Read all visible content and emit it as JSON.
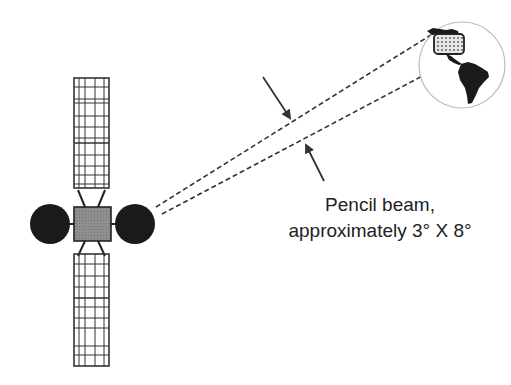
{
  "diagram": {
    "type": "satellite-pencil-beam",
    "caption": {
      "line1": "Pencil beam,",
      "line2": "approximately 3° X 8°"
    },
    "elements": {
      "satellite": {
        "solar_panels": 2,
        "antenna_dishes": 2,
        "body_color": "#8a8a8a",
        "dish_color": "#1a1a1a"
      },
      "beam": {
        "style": "dashed",
        "color": "#333333"
      },
      "earth": {
        "regions": [
          "North America (highlighted, dotted)",
          "South America"
        ]
      },
      "arrows": 2
    },
    "colors": {
      "line": "#333333",
      "dish": "#1a1a1a",
      "body": "#8a8a8a",
      "globe_outline": "#bbbbbb",
      "land": "#1a1a1a",
      "coverage_fill": "#dddddd"
    }
  }
}
